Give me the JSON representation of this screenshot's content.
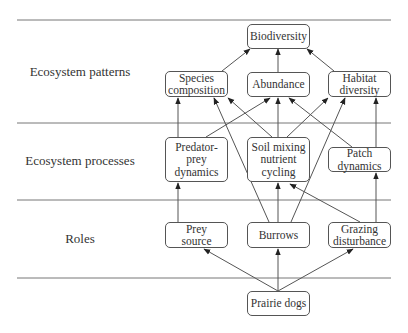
{
  "diagram": {
    "rows": [
      {
        "id": "patterns",
        "label": "Ecosystem patterns",
        "y": 72
      },
      {
        "id": "processes",
        "label": "Ecosystem processes",
        "y": 161
      },
      {
        "id": "roles",
        "label": "Roles",
        "y": 239
      }
    ],
    "separators_y": [
      20,
      123,
      200,
      278
    ],
    "nodes": [
      {
        "id": "biodiversity",
        "label": "Biodiversity",
        "x": 247,
        "y": 24,
        "w": 63,
        "h": 25
      },
      {
        "id": "species_composition",
        "label": "Species\ncomposition",
        "x": 165,
        "y": 71,
        "w": 63,
        "h": 26
      },
      {
        "id": "abundance",
        "label": "Abundance",
        "x": 247,
        "y": 72,
        "w": 63,
        "h": 25
      },
      {
        "id": "habitat_diversity",
        "label": "Habitat\ndiversity",
        "x": 328,
        "y": 71,
        "w": 63,
        "h": 26
      },
      {
        "id": "predator_prey",
        "label": "Predator-\nprey\ndynamics",
        "x": 165,
        "y": 137,
        "w": 63,
        "h": 45
      },
      {
        "id": "soil_mixing",
        "label": "Soil mixing\nnutrient\ncycling",
        "x": 247,
        "y": 137,
        "w": 63,
        "h": 45
      },
      {
        "id": "patch_dynamics",
        "label": "Patch\ndynamics",
        "x": 328,
        "y": 147,
        "w": 63,
        "h": 25
      },
      {
        "id": "prey_source",
        "label": "Prey\nsource",
        "x": 165,
        "y": 222,
        "w": 63,
        "h": 26
      },
      {
        "id": "burrows",
        "label": "Burrows",
        "x": 247,
        "y": 222,
        "w": 63,
        "h": 26
      },
      {
        "id": "grazing",
        "label": "Grazing\ndisturbance",
        "x": 328,
        "y": 222,
        "w": 63,
        "h": 26
      },
      {
        "id": "prairie_dogs",
        "label": "Prairie dogs",
        "x": 247,
        "y": 291,
        "w": 63,
        "h": 25
      }
    ],
    "edges": [
      {
        "from": "prairie_dogs",
        "to": "prey_source",
        "x1": 278,
        "y1": 291,
        "x2": 204,
        "y2": 249
      },
      {
        "from": "prairie_dogs",
        "to": "burrows",
        "x1": 278,
        "y1": 291,
        "x2": 278,
        "y2": 249
      },
      {
        "from": "prairie_dogs",
        "to": "grazing",
        "x1": 278,
        "y1": 291,
        "x2": 353,
        "y2": 249
      },
      {
        "from": "prey_source",
        "to": "predator_prey",
        "x1": 178,
        "y1": 222,
        "x2": 178,
        "y2": 183
      },
      {
        "from": "burrows",
        "to": "soil_mixing",
        "x1": 278,
        "y1": 222,
        "x2": 278,
        "y2": 183
      },
      {
        "from": "burrows",
        "to": "species_composition",
        "x1": 269,
        "y1": 222,
        "x2": 214,
        "y2": 98
      },
      {
        "from": "burrows",
        "to": "habitat_diversity",
        "x1": 291,
        "y1": 222,
        "x2": 345,
        "y2": 98
      },
      {
        "from": "grazing",
        "to": "soil_mixing",
        "x1": 360,
        "y1": 222,
        "x2": 290,
        "y2": 184
      },
      {
        "from": "grazing",
        "to": "patch_dynamics",
        "x1": 376,
        "y1": 222,
        "x2": 376,
        "y2": 173
      },
      {
        "from": "predator_prey",
        "to": "species_composition",
        "x1": 178,
        "y1": 137,
        "x2": 178,
        "y2": 98
      },
      {
        "from": "predator_prey",
        "to": "abundance",
        "x1": 206,
        "y1": 137,
        "x2": 270,
        "y2": 98
      },
      {
        "from": "soil_mixing",
        "to": "species_composition",
        "x1": 272,
        "y1": 137,
        "x2": 228,
        "y2": 98
      },
      {
        "from": "soil_mixing",
        "to": "abundance",
        "x1": 278,
        "y1": 137,
        "x2": 278,
        "y2": 98
      },
      {
        "from": "soil_mixing",
        "to": "habitat_diversity",
        "x1": 287,
        "y1": 137,
        "x2": 328,
        "y2": 98
      },
      {
        "from": "patch_dynamics",
        "to": "abundance",
        "x1": 352,
        "y1": 147,
        "x2": 289,
        "y2": 98
      },
      {
        "from": "patch_dynamics",
        "to": "habitat_diversity",
        "x1": 376,
        "y1": 147,
        "x2": 376,
        "y2": 98
      },
      {
        "from": "species_composition",
        "to": "biodiversity",
        "x1": 222,
        "y1": 71,
        "x2": 250,
        "y2": 49
      },
      {
        "from": "abundance",
        "to": "biodiversity",
        "x1": 278,
        "y1": 72,
        "x2": 278,
        "y2": 49
      },
      {
        "from": "habitat_diversity",
        "to": "biodiversity",
        "x1": 334,
        "y1": 71,
        "x2": 307,
        "y2": 49
      }
    ],
    "colors": {
      "line": "#555555",
      "text": "#333333",
      "background": "#ffffff"
    }
  }
}
